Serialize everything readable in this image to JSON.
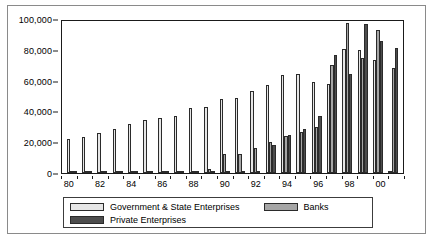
{
  "chart_data": {
    "type": "bar",
    "title": "",
    "xlabel": "",
    "ylabel": "",
    "ylim": [
      0,
      100000
    ],
    "yticks": [
      0,
      20000,
      40000,
      60000,
      80000,
      100000
    ],
    "ytick_labels": [
      "0",
      "20,000",
      "40,000",
      "60,000",
      "80,000",
      "100,000"
    ],
    "grid": false,
    "legend_position": "bottom",
    "categories": [
      "80",
      "81",
      "82",
      "83",
      "84",
      "85",
      "86",
      "87",
      "88",
      "89",
      "90",
      "91",
      "92",
      "93",
      "94",
      "95",
      "96",
      "97",
      "98",
      "99",
      "00",
      "01"
    ],
    "xtick_labels": [
      "80",
      "82",
      "84",
      "86",
      "88",
      "90",
      "92",
      "94",
      "96",
      "98",
      "00"
    ],
    "series": [
      {
        "name": "Government & State Enterprises",
        "color": "#e6e6e6",
        "values": [
          22000,
          23500,
          25700,
          28600,
          32100,
          34200,
          35400,
          36800,
          42000,
          42800,
          47900,
          48700,
          53200,
          57300,
          63500,
          64100,
          59000,
          57600,
          80800,
          80100,
          73400,
          0
        ]
      },
      {
        "name": "Banks",
        "color": "#a6a6a6",
        "values": [
          600,
          700,
          800,
          900,
          700,
          600,
          600,
          700,
          900,
          2800,
          12400,
          12200,
          16000,
          20300,
          24200,
          26500,
          29900,
          70100,
          97600,
          74700,
          92900,
          68000
        ]
      },
      {
        "name": "Private Enterprises",
        "color": "#4d4d4d",
        "values": [
          300,
          400,
          500,
          1000,
          1000,
          400,
          400,
          500,
          1100,
          400,
          400,
          400,
          400,
          18200,
          25000,
          28400,
          36800,
          76800,
          64000,
          97000,
          85600,
          81000
        ]
      }
    ]
  },
  "legend": {
    "items": [
      {
        "label": "Government & State Enterprises"
      },
      {
        "label": "Banks"
      },
      {
        "label": "Private Enterprises"
      }
    ]
  }
}
